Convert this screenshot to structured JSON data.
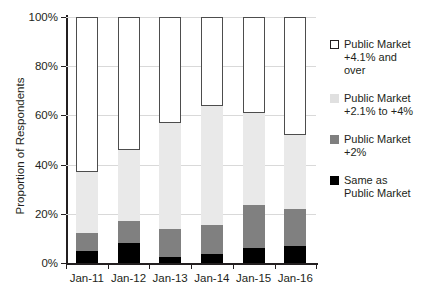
{
  "chart_data": {
    "type": "bar",
    "subtype": "stacked-bar-100",
    "title": "",
    "xlabel": "",
    "ylabel": "Proportion of Respondents",
    "ylim": [
      0,
      100
    ],
    "yticks": [
      0,
      20,
      40,
      60,
      80,
      100
    ],
    "ytick_labels": [
      "0%",
      "20%",
      "40%",
      "60%",
      "80%",
      "100%"
    ],
    "grid": true,
    "legend_position": "right",
    "categories": [
      "Jan-11",
      "Jan-12",
      "Jan-13",
      "Jan-14",
      "Jan-15",
      "Jan-16"
    ],
    "series": [
      {
        "name": "Same as Public Market",
        "color": "#000000",
        "values": [
          5,
          8,
          2.5,
          3.5,
          6,
          7
        ]
      },
      {
        "name": "Public Market +2%",
        "color": "#808080",
        "values": [
          7,
          9,
          11.5,
          12,
          17.5,
          15
        ]
      },
      {
        "name": "Public Market +2.1% to +4%",
        "color": "#e9e9e9",
        "values": [
          25,
          29,
          43,
          48.5,
          37.5,
          30
        ]
      },
      {
        "name": "Public Market +4.1% and over",
        "color": "#ffffff",
        "values": [
          63,
          54,
          43,
          36,
          39,
          48
        ]
      }
    ]
  },
  "axes": {
    "y_title": "Proportion of Respondents",
    "y_tick_labels": [
      "100%",
      "80%",
      "60%",
      "40%",
      "20%",
      "0%"
    ],
    "x_tick_labels": [
      "Jan-11",
      "Jan-12",
      "Jan-13",
      "Jan-14",
      "Jan-15",
      "Jan-16"
    ]
  },
  "legend": {
    "items": [
      {
        "label": "Public Market\n+4.1% and\nover",
        "swatch": "open-square-icon",
        "color": "#ffffff"
      },
      {
        "label": "Public Market\n+2.1% to +4%",
        "swatch": "light-gray-square-icon",
        "color": "#e0e0e0"
      },
      {
        "label": "Public Market\n+2%",
        "swatch": "mid-gray-square-icon",
        "color": "#7f7f7f"
      },
      {
        "label": "Same as\nPublic Market",
        "swatch": "black-square-icon",
        "color": "#000000"
      }
    ]
  }
}
